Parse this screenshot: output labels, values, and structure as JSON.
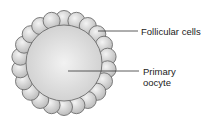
{
  "diagram": {
    "labels": [
      {
        "id": "follicular",
        "text": "Follicular cells"
      },
      {
        "id": "oocyte",
        "line1": "Primary",
        "line2": "oocyte"
      }
    ],
    "follicular_cell_count": 22,
    "colors": {
      "cell_fill": "#d6d6d6",
      "cell_stroke": "#6e6e6e",
      "line": "#333333"
    }
  }
}
